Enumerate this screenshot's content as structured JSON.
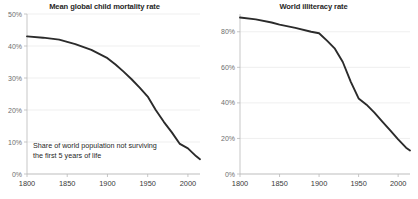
{
  "chart_data": [
    {
      "type": "line",
      "title": "Mean global child mortality rate",
      "annotation_line1": "Share of world population not surviving",
      "annotation_line2": "the first 5 years of life",
      "xlabel": "",
      "ylabel": "",
      "xlim": [
        1800,
        2015
      ],
      "ylim": [
        0,
        50
      ],
      "grid": true,
      "legend": "none",
      "line_color": "#2b2b2b",
      "xticks": [
        "1800",
        "1850",
        "1900",
        "1950",
        "2000"
      ],
      "xtick_values": [
        1800,
        1850,
        1900,
        1950,
        2000
      ],
      "yticks": [
        "0%",
        "10%",
        "20%",
        "30%",
        "40%",
        "50%"
      ],
      "ytick_values": [
        0,
        10,
        20,
        30,
        40,
        50
      ],
      "x": [
        1800,
        1820,
        1840,
        1850,
        1860,
        1880,
        1900,
        1910,
        1920,
        1930,
        1940,
        1950,
        1960,
        1970,
        1980,
        1990,
        2000,
        2010,
        2015
      ],
      "values": [
        43.0,
        42.6,
        42.0,
        41.3,
        40.6,
        38.8,
        36.2,
        34.2,
        32.0,
        29.6,
        27.0,
        24.2,
        20.0,
        16.3,
        13.0,
        9.4,
        8.0,
        5.6,
        4.6
      ]
    },
    {
      "type": "line",
      "title": "World illiteracy rate",
      "xlabel": "",
      "ylabel": "",
      "xlim": [
        1800,
        2015
      ],
      "ylim": [
        0,
        90
      ],
      "grid": true,
      "legend": "none",
      "line_color": "#2b2b2b",
      "xticks": [
        "1800",
        "1850",
        "1900",
        "1950",
        "2000"
      ],
      "xtick_values": [
        1800,
        1850,
        1900,
        1950,
        2000
      ],
      "yticks": [
        "0%",
        "20%",
        "40%",
        "60%",
        "80%"
      ],
      "ytick_values": [
        0,
        20,
        40,
        60,
        80
      ],
      "x": [
        1800,
        1820,
        1840,
        1850,
        1870,
        1890,
        1900,
        1910,
        1920,
        1930,
        1940,
        1950,
        1960,
        1970,
        1980,
        1990,
        2000,
        2010,
        2015
      ],
      "values": [
        88.0,
        87.0,
        85.2,
        84.0,
        82.2,
        80.0,
        79.2,
        75.0,
        70.5,
        63.0,
        52.0,
        42.5,
        39.0,
        34.5,
        29.5,
        24.5,
        19.5,
        14.8,
        13.2
      ]
    }
  ]
}
